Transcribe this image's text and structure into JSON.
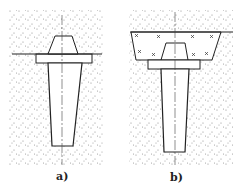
{
  "figure": {
    "panels": [
      {
        "label": "a)",
        "description": "Precast column footing set on ground surface"
      },
      {
        "label": "b)",
        "description": "Precast column footing set in backfilled excavation"
      }
    ]
  },
  "colors": {
    "line": "#222222",
    "stipple": "#8a8a8a",
    "background": "#ffffff"
  }
}
